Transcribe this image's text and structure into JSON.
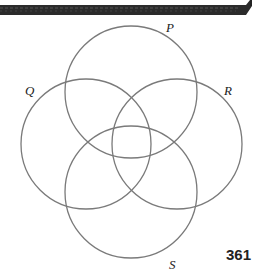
{
  "diagram": {
    "type": "venn",
    "sets": [
      {
        "name": "P",
        "label": "P"
      },
      {
        "name": "Q",
        "label": "Q"
      },
      {
        "name": "R",
        "label": "R"
      },
      {
        "name": "S",
        "label": "S"
      }
    ],
    "stroke_color": "#7a7a7a"
  },
  "page_number": "361"
}
